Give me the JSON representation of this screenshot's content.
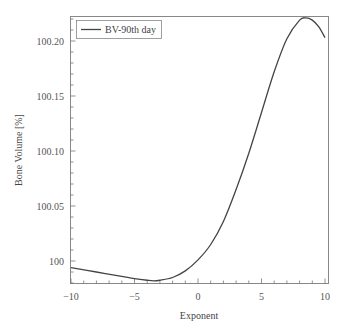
{
  "chart_data": {
    "type": "line",
    "title": "",
    "xlabel": "Exponent",
    "ylabel": "Bone Volume [%]",
    "xlim": [
      -10,
      10
    ],
    "ylim": [
      99.98,
      100.22
    ],
    "xticks": [
      -10,
      -5,
      0,
      5,
      10
    ],
    "xtick_labels": [
      "−10",
      "−5",
      "0",
      "5",
      "10"
    ],
    "yticks": [
      100,
      100.05,
      100.1,
      100.15,
      100.2
    ],
    "ytick_labels": [
      "100",
      "100.05",
      "100.10",
      "100.15",
      "100.20"
    ],
    "grid": false,
    "legend_position": "upper left",
    "series": [
      {
        "name": "BV-90th day",
        "color": "#444444",
        "x": [
          -10,
          -8,
          -6,
          -5,
          -4,
          -3.5,
          -3,
          -2,
          -1,
          0,
          1,
          2,
          3,
          4,
          5,
          6,
          7,
          8,
          8.5,
          9,
          9.5,
          10
        ],
        "y": [
          99.994,
          99.99,
          99.986,
          99.984,
          99.9825,
          99.982,
          99.9825,
          99.985,
          99.991,
          100.001,
          100.015,
          100.036,
          100.065,
          100.098,
          100.135,
          100.172,
          100.202,
          100.219,
          100.221,
          100.219,
          100.213,
          100.203
        ]
      }
    ]
  }
}
